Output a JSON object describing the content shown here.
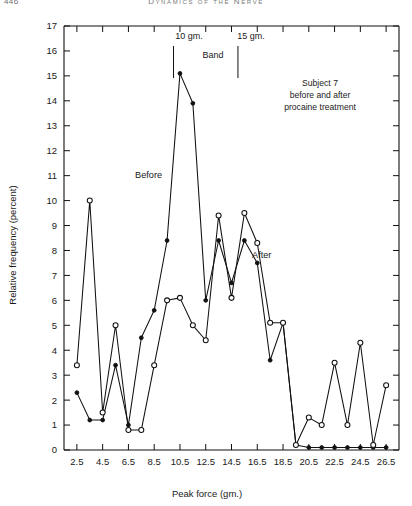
{
  "running_head": {
    "page_number": "446",
    "title": "Dynamics of the Nerve"
  },
  "figure": {
    "annotations": {
      "band_left_label": "10 gm.",
      "band_right_label": "15 gm.",
      "band_label": "Band",
      "caption_line1": "Subject 7",
      "caption_line2": "before and after",
      "caption_line3": "procaine treatment",
      "series_label_before": "Before",
      "series_label_after": "After"
    },
    "colors": {
      "axis": "#111111",
      "line": "#111111",
      "marker_fill_open": "#ffffff",
      "marker_fill_closed": "#111111"
    }
  },
  "chart_data": {
    "type": "line",
    "title": "",
    "xlabel": "Peak force (gm.)",
    "ylabel": "Relative frequency (percent)",
    "xlim": [
      1.5,
      27.5
    ],
    "ylim": [
      0,
      17
    ],
    "grid": false,
    "legend": "inline-annotations",
    "xticks": [
      2.5,
      4.5,
      6.5,
      8.5,
      10.5,
      12.5,
      14.5,
      16.5,
      18.5,
      20.5,
      22.5,
      24.5,
      26.5
    ],
    "xticklabels": [
      "2.5",
      "4.5",
      "6.5",
      "8.5",
      "10.5",
      "12.5",
      "14.5",
      "16.5",
      "18.5",
      "20.5",
      "22.5",
      "24.5",
      "26.5"
    ],
    "yticks": [
      0,
      1,
      2,
      3,
      4,
      5,
      6,
      7,
      8,
      9,
      10,
      11,
      12,
      13,
      14,
      15,
      16,
      17
    ],
    "yticklabels": [
      "0",
      "1",
      "2",
      "3",
      "4",
      "5",
      "6",
      "7",
      "8",
      "9",
      "10",
      "11",
      "12",
      "13",
      "14",
      "15",
      "16",
      "17"
    ],
    "band_markers": [
      10,
      15
    ],
    "x": [
      2.5,
      3.5,
      4.5,
      5.5,
      6.5,
      7.5,
      8.5,
      9.5,
      10.5,
      11.5,
      12.5,
      13.5,
      14.5,
      15.5,
      16.5,
      17.5,
      18.5,
      19.5,
      20.5,
      21.5,
      22.5,
      23.5,
      24.5,
      25.5,
      26.5
    ],
    "series": [
      {
        "name": "Before",
        "marker": "filled-circle",
        "values": [
          2.3,
          1.2,
          1.2,
          3.4,
          1.0,
          4.5,
          5.6,
          8.4,
          15.1,
          13.9,
          6.0,
          8.4,
          6.7,
          8.4,
          7.5,
          3.6,
          5.1,
          0.2,
          0.1,
          0.1,
          0.1,
          0.1,
          0.1,
          0.1,
          0.1
        ]
      },
      {
        "name": "After",
        "marker": "open-circle",
        "values": [
          3.4,
          10.0,
          1.5,
          5.0,
          0.8,
          0.8,
          3.4,
          6.0,
          6.1,
          5.0,
          4.4,
          9.4,
          6.1,
          9.5,
          8.3,
          5.1,
          5.1,
          0.2,
          1.3,
          1.0,
          3.5,
          1.0,
          4.3,
          0.2,
          2.6
        ]
      }
    ]
  }
}
